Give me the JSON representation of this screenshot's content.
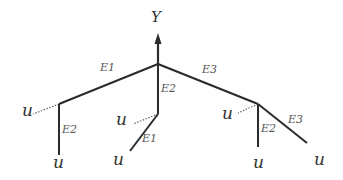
{
  "diagram": {
    "type": "tree",
    "root_label": "Y",
    "colors": {
      "edge": "#2b2b2b",
      "dotted": "#666666",
      "text": "#333333"
    },
    "edge_labels": {
      "top_left": "E1",
      "top_middle": "E2",
      "top_right": "E3",
      "left_branch": "E2",
      "middle_branch": "E1",
      "right_vertical": "E2",
      "right_diagonal": "E3"
    },
    "leaf_labels": {
      "left_dotted": "u",
      "left_bottom": "u",
      "middle_dotted": "u",
      "middle_bottom": "u",
      "right_dotted": "u",
      "right_bottom": "u",
      "right_far": "u"
    }
  }
}
